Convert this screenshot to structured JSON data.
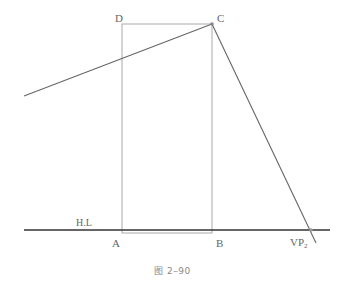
{
  "diagram": {
    "labels": {
      "A": "A",
      "B": "B",
      "C": "C",
      "D": "D",
      "horizon_line": "H.L",
      "vanishing_point_base": "VP",
      "vanishing_point_sub": "2"
    },
    "caption": "图 2–90",
    "colors": {
      "rectangle": "#aaaaaa",
      "construction_line": "#666666",
      "horizon_line": "#333333"
    },
    "geometry": {
      "rectangle": {
        "x1": 122,
        "y1": 24,
        "x2": 212,
        "y2": 233
      },
      "horizon_line": {
        "x1": 24,
        "y1": 230,
        "x2": 330,
        "y2": 230
      },
      "line_left_to_C": {
        "x1": 24,
        "y1": 96,
        "x2": 212,
        "y2": 24
      },
      "line_C_to_VP2": {
        "x1": 212,
        "y1": 24,
        "x2": 316,
        "y2": 243
      },
      "point_C": {
        "x": 212,
        "y": 24
      },
      "point_VP2": {
        "x": 311,
        "y": 230
      }
    }
  }
}
